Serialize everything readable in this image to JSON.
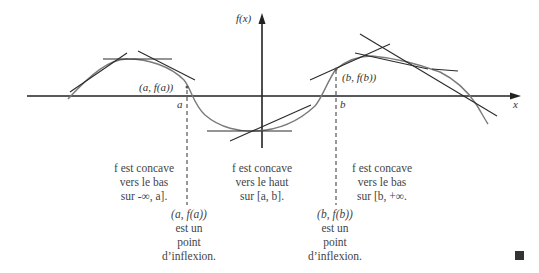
{
  "axes": {
    "y_label": "f(x)",
    "x_label": "x",
    "a_label": "a",
    "b_label": "b"
  },
  "points": {
    "a_point": "(a, f(a))",
    "b_point": "(b, f(b))"
  },
  "regions": [
    {
      "lines": [
        "f est concave",
        "vers le bas",
        "sur -∞, a]."
      ]
    },
    {
      "lines": [
        "f est concave",
        "vers le haut",
        "sur [a, b]."
      ]
    },
    {
      "lines": [
        "f est concave",
        "vers le bas",
        "sur [b, +∞."
      ]
    }
  ],
  "inflections": [
    {
      "lines": [
        "(a, f(a))",
        "est un",
        "point",
        "d’inflexion."
      ]
    },
    {
      "lines": [
        "(b, f(b))",
        "est un",
        "point",
        "d’inflexion."
      ]
    }
  ],
  "colors": {
    "axis": "#222222",
    "curve": "#777777",
    "tangent": "#2a2a2a",
    "text": "#444444"
  }
}
